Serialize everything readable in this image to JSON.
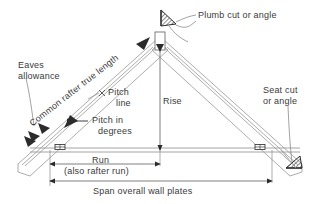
{
  "diagram": {
    "background_color": "#ffffff",
    "line_color": "#9a9a9a",
    "dim_line_color": "#8c8c8c",
    "text_color": "#3a3a3a",
    "marker_color": "#2b2b2b",
    "labels": {
      "eaves_allowance": "Eaves\nallowance",
      "eaves_allowance_line1": "Eaves",
      "eaves_allowance_line2": "allowance",
      "common_rafter_true_length": "Common rafter true length",
      "plumb_cut": "Plumb cut or angle",
      "seat_cut_line1": "Seat cut",
      "seat_cut_line2": "or angle",
      "pitch_line_l1": "Pitch",
      "pitch_line_l2": "line",
      "pitch_degrees_l1": "Pitch in",
      "pitch_degrees_l2": "degrees",
      "rise": "Rise",
      "run": "Run",
      "run_note": "(also rafter run)",
      "span": "Span overall wall plates"
    },
    "icons": {
      "plumb_cut_marker": "plumb-cut-wedge-icon",
      "seat_cut_marker": "seat-cut-wedge-icon",
      "wall_plate_left": "wall-plate-icon",
      "wall_plate_right": "wall-plate-icon",
      "pitch_line_cross": "cross-tick-icon"
    },
    "geometry": {
      "ridge_apex": [
        160,
        40
      ],
      "left_plate": [
        58,
        148
      ],
      "right_plate": [
        262,
        148
      ],
      "left_tail": [
        22,
        168
      ],
      "right_tail": [
        300,
        168
      ],
      "run_dim_y": 162,
      "span_dim_y": 182
    }
  }
}
